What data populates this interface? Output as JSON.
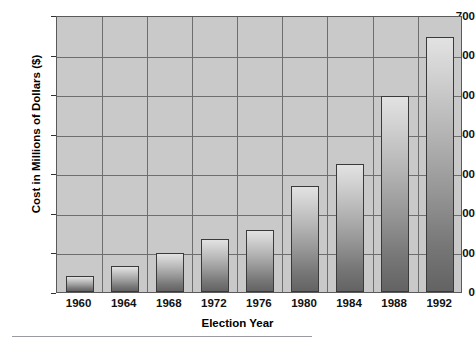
{
  "chart_data": {
    "type": "bar",
    "title": "",
    "xlabel": "Election Year",
    "ylabel": "Cost in Millions of Dollars ($)",
    "categories": [
      "1960",
      "1964",
      "1968",
      "1972",
      "1976",
      "1980",
      "1984",
      "1988",
      "1992"
    ],
    "values": [
      40,
      67,
      100,
      135,
      157,
      270,
      325,
      500,
      648
    ],
    "ylim": [
      0,
      700
    ],
    "yticks": [
      0,
      100,
      200,
      300,
      400,
      500,
      600,
      700
    ],
    "ytick_labels": [
      "0",
      "100",
      "200",
      "300",
      "400",
      "500",
      "600",
      "700"
    ],
    "grid": true,
    "grid_axis": "both",
    "legend": false,
    "legend_position": "none",
    "plot_background": "#c9c9c9",
    "bar_fill_light": "#e2e2e2",
    "bar_fill_dark": "#636363",
    "bar_edge_color": "#3a3a3a",
    "gridline_color": "#6e6e6e",
    "text_color": "#111111"
  }
}
